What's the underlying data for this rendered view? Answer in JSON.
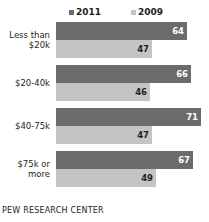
{
  "footer": {
    "source": "PEW RESEARCH CENTER"
  },
  "colors": {
    "series_2011": "#6b6b6b",
    "series_2009": "#c4c4c4",
    "text": "#231f20",
    "background": "#ffffff"
  },
  "chart_data": {
    "type": "bar",
    "orientation": "horizontal",
    "title": "",
    "subtitle": "",
    "xlabel": "",
    "ylabel": "",
    "grid": false,
    "legend_position": "top",
    "xlim": [
      0,
      100
    ],
    "categories": [
      "Less than\n$20k",
      "$20-40k",
      "$40-75k",
      "$75k or\nmore"
    ],
    "series": [
      {
        "name": "2011",
        "color": "#6b6b6b",
        "values": [
          64,
          66,
          71,
          67
        ]
      },
      {
        "name": "2009",
        "color": "#c4c4c4",
        "values": [
          47,
          46,
          47,
          49
        ]
      }
    ]
  }
}
